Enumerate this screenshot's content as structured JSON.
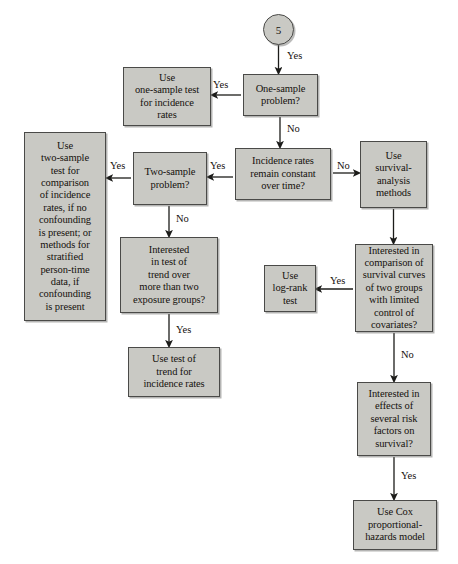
{
  "figure": {
    "type": "decision-flowchart"
  },
  "start": {
    "id": "start",
    "label": "5",
    "shape": "circle",
    "x": 263,
    "y": 14,
    "w": 31,
    "h": 31
  },
  "nodes": [
    {
      "id": "one_sample_problem",
      "label": "One-sample\nproblem?",
      "kind": "decision",
      "x": 243,
      "y": 74,
      "w": 75,
      "h": 42,
      "font": 10.5
    },
    {
      "id": "use_one_sample_test",
      "label": "Use\none-sample test\nfor incidence\nrates",
      "kind": "terminal",
      "x": 123,
      "y": 67,
      "w": 88,
      "h": 59,
      "font": 10.5
    },
    {
      "id": "incidence_rates_constant",
      "label": "Incidence rates\nremain constant\nover time?",
      "kind": "decision",
      "x": 235,
      "y": 148,
      "w": 96,
      "h": 52,
      "font": 10.5
    },
    {
      "id": "two_sample_problem",
      "label": "Two-sample\nproblem?",
      "kind": "decision",
      "x": 133,
      "y": 152,
      "w": 74,
      "h": 53,
      "font": 10.5
    },
    {
      "id": "use_two_sample_test",
      "label": "Use\ntwo-sample\ntest for\ncomparison\nof incidence\nrates, if no\nconfounding\nis present; or\nmethods for\nstratified\nperson-time\ndata, if\nconfounding\nis present",
      "kind": "terminal",
      "x": 24,
      "y": 132,
      "w": 82,
      "h": 189,
      "font": 10.5
    },
    {
      "id": "use_survival_analysis",
      "label": "Use\nsurvival-\nanalysis\nmethods",
      "kind": "terminal",
      "x": 360,
      "y": 141,
      "w": 67,
      "h": 67,
      "font": 10.5
    },
    {
      "id": "interested_trend",
      "label": "Interested\nin test of\ntrend over\nmore than two\nexposure groups?",
      "kind": "decision",
      "x": 120,
      "y": 237,
      "w": 98,
      "h": 76,
      "font": 10.5
    },
    {
      "id": "use_test_of_trend",
      "label": "Use test of\ntrend for\nincidence rates",
      "kind": "terminal",
      "x": 128,
      "y": 347,
      "w": 92,
      "h": 50,
      "font": 10.5
    },
    {
      "id": "interested_survival_curves",
      "label": "Interested in\ncomparison of\nsurvival curves\nof two groups\nwith limited\ncontrol of\ncovariates?",
      "kind": "decision",
      "x": 355,
      "y": 244,
      "w": 78,
      "h": 88,
      "font": 10.5
    },
    {
      "id": "use_log_rank_test",
      "label": "Use\nlog-rank\ntest",
      "kind": "terminal",
      "x": 264,
      "y": 265,
      "w": 52,
      "h": 47,
      "font": 10.5
    },
    {
      "id": "interested_risk_factors",
      "label": "Interested in\neffects of\nseveral risk\nfactors on\nsurvival?",
      "kind": "decision",
      "x": 357,
      "y": 382,
      "w": 74,
      "h": 74,
      "font": 10.5
    },
    {
      "id": "use_cox_model",
      "label": "Use Cox\nproportional-\nhazards model",
      "kind": "terminal",
      "x": 353,
      "y": 500,
      "w": 84,
      "h": 50,
      "font": 10.5
    }
  ],
  "edges": [
    {
      "id": "start-to-one-sample",
      "label": "Yes",
      "label_x": 287,
      "label_y": 51,
      "path": "M 278.5,45 L 278.5,71",
      "arrow": "down"
    },
    {
      "id": "one-sample-yes-to-use-one",
      "label": "Yes",
      "label_x": 213,
      "label_y": 80,
      "path": "M 241,95 L 214,95",
      "arrow": "left"
    },
    {
      "id": "one-sample-no-to-incidence",
      "label": "No",
      "label_x": 287,
      "label_y": 124,
      "path": "M 280,117 L 280,145",
      "arrow": "down"
    },
    {
      "id": "incidence-yes-to-two-sample",
      "label": "Yes",
      "label_x": 210,
      "label_y": 161,
      "path": "M 233,177 L 210,177",
      "arrow": "left"
    },
    {
      "id": "incidence-no-to-survival",
      "label": "No",
      "label_x": 337,
      "label_y": 161,
      "path": "M 333,173 L 357,173",
      "arrow": "right"
    },
    {
      "id": "two-sample-yes-to-use-two",
      "label": "Yes",
      "label_x": 110,
      "label_y": 161,
      "path": "M 131,178 L 109,178",
      "arrow": "left"
    },
    {
      "id": "two-sample-no-to-trend",
      "label": "No",
      "label_x": 176,
      "label_y": 214,
      "path": "M 169,206 L 169,234",
      "arrow": "down"
    },
    {
      "id": "trend-yes-to-use-trend",
      "label": "Yes",
      "label_x": 176,
      "label_y": 325,
      "path": "M 169,314 L 169,344",
      "arrow": "down"
    },
    {
      "id": "survival-to-interested-curves",
      "label": "",
      "label_x": 0,
      "label_y": 0,
      "path": "M 393.5,209 L 393.5,241",
      "arrow": "down"
    },
    {
      "id": "curves-yes-to-log-rank",
      "label": "Yes",
      "label_x": 330,
      "label_y": 276,
      "path": "M 353,289 L 318,289",
      "arrow": "left"
    },
    {
      "id": "curves-no-to-risk-factors",
      "label": "No",
      "label_x": 401,
      "label_y": 350,
      "path": "M 394,333 L 394,379",
      "arrow": "down"
    },
    {
      "id": "risk-factors-yes-to-cox",
      "label": "Yes",
      "label_x": 401,
      "label_y": 471,
      "path": "M 394,457 L 394,497",
      "arrow": "down"
    }
  ],
  "colors": {
    "node_fill": "#c9c9c4",
    "node_border": "#4a4a48",
    "text": "#15110d",
    "edge": "#1c1c1a",
    "page_background": "#ffffff"
  }
}
